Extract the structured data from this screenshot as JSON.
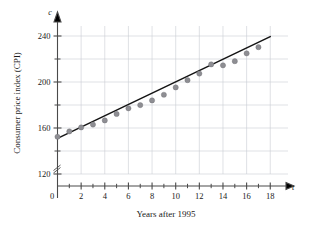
{
  "chart_data": {
    "type": "scatter",
    "title": "",
    "xlabel": "Years after 1995",
    "ylabel": "Consumer price index (CPI)",
    "x_variable_symbol": "t",
    "y_variable_symbol": "c",
    "xlim": [
      0,
      19.5
    ],
    "ylim": [
      110,
      248
    ],
    "grid": true,
    "legend": "none",
    "axis_break_on_y": true,
    "x_major_ticks": [
      0,
      2,
      4,
      6,
      8,
      10,
      12,
      14,
      16,
      18
    ],
    "x_minor_ticks": [
      1,
      3,
      5,
      7,
      9,
      11,
      13,
      15,
      17
    ],
    "x_tick_labels": [
      "0",
      "2",
      "4",
      "6",
      "8",
      "10",
      "12",
      "14",
      "16",
      "18"
    ],
    "y_major_ticks": [
      120,
      160,
      200,
      240
    ],
    "y_minor_ticks": [
      140,
      180,
      220
    ],
    "y_tick_labels": [
      "120",
      "160",
      "200",
      "240"
    ],
    "x": [
      0,
      1,
      2,
      3,
      4,
      5,
      6,
      7,
      8,
      9,
      10,
      11,
      12,
      13,
      14,
      15,
      16,
      17
    ],
    "values": [
      152.4,
      157.0,
      160.5,
      163.0,
      166.6,
      172.2,
      177.1,
      179.9,
      184.0,
      188.9,
      195.3,
      201.6,
      207.3,
      215.3,
      214.5,
      218.1,
      224.9,
      230.3
    ],
    "series": [
      {
        "name": "CPI data points",
        "marker": "circle",
        "color": "#8e8e93",
        "values": [
          152.4,
          157.0,
          160.5,
          163.0,
          166.6,
          172.2,
          177.1,
          179.9,
          184.0,
          188.9,
          195.3,
          201.6,
          207.3,
          215.3,
          214.5,
          218.1,
          224.9,
          230.3
        ]
      },
      {
        "name": "Linear trend line",
        "type": "line",
        "color": "#141414",
        "endpoints": [
          {
            "x": 0,
            "y": 151.0
          },
          {
            "x": 18,
            "y": 239.5
          }
        ]
      }
    ],
    "annotations": []
  }
}
